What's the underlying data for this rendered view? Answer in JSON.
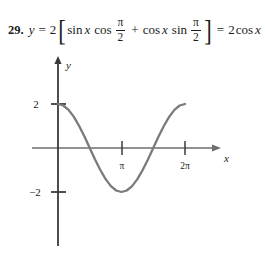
{
  "problem": {
    "number": "29.",
    "lhs_var": "y",
    "equals": "=",
    "coefficient": "2",
    "bracket_open": "[",
    "bracket_close": "]",
    "term1": {
      "fn1": "sin",
      "var1": "x",
      "fn2": "cos",
      "frac_num": "π",
      "frac_den": "2"
    },
    "plus": "+",
    "term2": {
      "fn1": "cos",
      "var1": "x",
      "fn2": "sin",
      "frac_num": "π",
      "frac_den": "2"
    },
    "equals2": "=",
    "rhs": {
      "coefficient": "2",
      "fn": "cos",
      "var": "x"
    },
    "full_text": "29. y = 2[sin x cos π/2 + cos x sin π/2] = 2 cos x"
  },
  "graph": {
    "y_axis_label": "y",
    "x_axis_label": "x",
    "y_ticks": [
      {
        "label": "2",
        "value": 2
      },
      {
        "label": "−2",
        "value": -2
      }
    ],
    "x_ticks": [
      {
        "label": "π",
        "value": 3.14159
      },
      {
        "label": "2π",
        "value": 6.28319
      }
    ],
    "colors": {
      "curve": "#7a7a7a",
      "axis": "#6e6e6e",
      "y_axis": "#3a3a3a",
      "text": "#1a1a1a"
    }
  },
  "chart_data": {
    "type": "line",
    "title": "",
    "xlabel": "x",
    "ylabel": "y",
    "equation": "y = 2 cos x",
    "xlim": [
      0,
      6.6
    ],
    "ylim": [
      -2.6,
      2.6
    ],
    "grid": false,
    "legend": "none",
    "xtick_values": [
      3.14159,
      6.28319
    ],
    "xtick_labels": [
      "π",
      "2π"
    ],
    "ytick_values": [
      2,
      -2
    ],
    "ytick_labels": [
      "2",
      "−2"
    ],
    "series": [
      {
        "name": "y = 2 cos x",
        "x": [
          0,
          0.2618,
          0.5236,
          0.7854,
          1.0472,
          1.309,
          1.5708,
          1.8326,
          2.0944,
          2.3562,
          2.618,
          2.8798,
          3.1416,
          3.4034,
          3.6652,
          3.927,
          4.1888,
          4.4506,
          4.7124,
          4.9742,
          5.236,
          5.4978,
          5.7596,
          6.0214,
          6.2832
        ],
        "y": [
          2.0,
          1.932,
          1.732,
          1.414,
          1.0,
          0.518,
          0.0,
          -0.518,
          -1.0,
          -1.414,
          -1.732,
          -1.932,
          -2.0,
          -1.932,
          -1.732,
          -1.414,
          -1.0,
          -0.518,
          0.0,
          0.518,
          1.0,
          1.414,
          1.732,
          1.932,
          2.0
        ]
      }
    ]
  }
}
